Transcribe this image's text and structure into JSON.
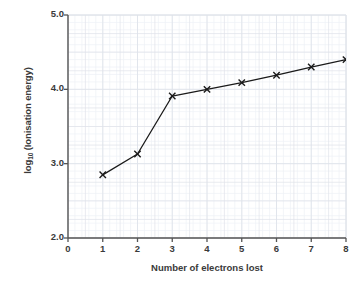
{
  "chart_data": {
    "type": "line",
    "title": "",
    "xlabel": "Number of electrons lost",
    "ylabel_html": "log10 (Ionisation energy)",
    "ylabel_main": "log",
    "ylabel_sub": "10",
    "ylabel_rest": " (Ionisation energy)",
    "x": [
      1,
      2,
      3,
      4,
      5,
      6,
      7,
      8
    ],
    "values": [
      2.85,
      3.13,
      3.91,
      4.0,
      4.09,
      4.19,
      4.3,
      4.4
    ],
    "xlim": [
      0,
      8
    ],
    "ylim": [
      2.0,
      5.0
    ],
    "xticks": [
      "0",
      "1",
      "2",
      "3",
      "4",
      "5",
      "6",
      "7",
      "8"
    ],
    "xtick_values": [
      0,
      1,
      2,
      3,
      4,
      5,
      6,
      7,
      8
    ],
    "yticks": [
      "2.0",
      "3.0",
      "4.0",
      "5.0"
    ],
    "ytick_values": [
      2.0,
      3.0,
      4.0,
      5.0
    ],
    "grid": true,
    "minor_grid": true,
    "legend": null,
    "marker": "x",
    "line_color": "#1a1a1a",
    "marker_color": "#1a1a1a",
    "grid_color": "#dfe3ea",
    "minor_grid_color": "#eef1f6",
    "axis_color": "#555555",
    "text_color": "#3a3a3a",
    "background": "#ffffff"
  }
}
